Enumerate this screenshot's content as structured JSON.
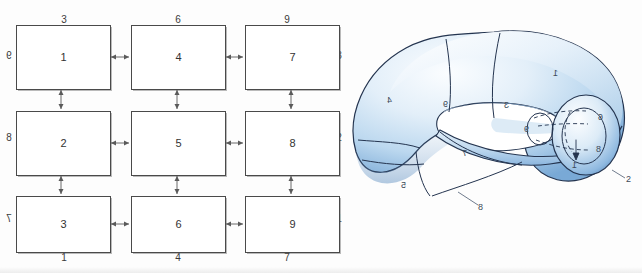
{
  "figure": {
    "caption": "",
    "left_panel": {
      "title": "3x3 grid of linked cells",
      "cells": [
        {
          "id": "r1c1",
          "label": "1"
        },
        {
          "id": "r1c2",
          "label": "4"
        },
        {
          "id": "r1c3",
          "label": "7"
        },
        {
          "id": "r2c1",
          "label": "2"
        },
        {
          "id": "r2c2",
          "label": "5"
        },
        {
          "id": "r2c3",
          "label": "8"
        },
        {
          "id": "r3c1",
          "label": "3"
        },
        {
          "id": "r3c2",
          "label": "6"
        },
        {
          "id": "r3c3",
          "label": "9"
        }
      ],
      "top_labels": [
        "3",
        "6",
        "9"
      ],
      "bottom_labels": [
        "1",
        "4",
        "7"
      ],
      "left_labels": [
        "9",
        "8",
        "7"
      ],
      "right_labels": [
        "3",
        "2",
        "1"
      ],
      "arrow_glyph": "double-headed-arrow"
    },
    "right_panel": {
      "title": "self-intersecting torus (Klein bottle) with numbered regions",
      "surface_colors": {
        "outline": "#1d2a44",
        "fill_light": "#f2f7fc",
        "fill_mid": "#c7ddf0",
        "fill_deep": "#7aa9d4",
        "shadow": "#4d7fb5"
      },
      "region_labels": [
        {
          "id": "lbl-1",
          "text": "1"
        },
        {
          "id": "lbl-2",
          "text": "2"
        },
        {
          "id": "lbl-3",
          "text": "3"
        },
        {
          "id": "lbl-4",
          "text": "4"
        },
        {
          "id": "lbl-5",
          "text": "5"
        },
        {
          "id": "lbl-6",
          "text": "6"
        },
        {
          "id": "lbl-7",
          "text": "7"
        },
        {
          "id": "lbl-8",
          "text": "8"
        },
        {
          "id": "lbl-9-inner",
          "text": "9"
        },
        {
          "id": "lbl-9-tube",
          "text": "9"
        },
        {
          "id": "lbl-7-lower",
          "text": "7"
        },
        {
          "id": "lbl-8-leader",
          "text": "8"
        },
        {
          "id": "lbl-2-leader",
          "text": "2"
        }
      ]
    }
  }
}
